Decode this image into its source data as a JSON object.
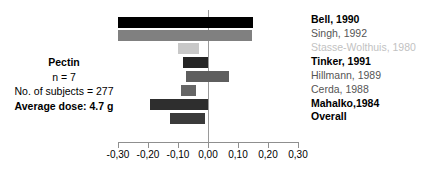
{
  "figure": {
    "info_block": {
      "lines": [
        {
          "text": "Pectin",
          "bold": true
        },
        {
          "text": "n = 7",
          "bold": false
        },
        {
          "text": "No. of subjects = 277",
          "bold": false
        },
        {
          "text": "Average dose: 4.7 g",
          "bold": true
        }
      ]
    },
    "axis": {
      "tick_labels": [
        "-0,30",
        "-0,20",
        "-0,10",
        "0,00",
        "0,10",
        "0,20",
        "0,30"
      ],
      "tick_values": [
        -0.3,
        -0.2,
        -0.1,
        0.0,
        0.1,
        0.2,
        0.3
      ]
    },
    "caption": "",
    "colors": {
      "zero_line": "#9a9a9a",
      "axis": "#8f8f8f",
      "black": "#000000",
      "mid_gray": "#808080",
      "light_gray": "#c8c8c8",
      "dark_gray": "#3a3a3a",
      "gray_55": "#5e5e5e",
      "gray_60": "#666666",
      "label_gray": "#555555",
      "label_light": "#c2c2c2"
    }
  },
  "chart_data": {
    "type": "bar",
    "orientation": "horizontal",
    "title": "",
    "xlabel": "",
    "ylabel": "",
    "xlim": [
      -0.3,
      0.3
    ],
    "grid": false,
    "legend": "none",
    "zero_reference": 0.0,
    "categories": [
      "Bell, 1990",
      "Singh, 1992",
      "Stasse-Wolthuis, 1980",
      "Tinker, 1991",
      "Hillmann, 1989",
      "Cerda, 1988",
      "Mahalko,1984",
      "Overall"
    ],
    "bars": [
      {
        "label": "Bell, 1990",
        "start": -0.3,
        "end": 0.15,
        "color": "#000000",
        "label_color": "#000000",
        "label_bold": true
      },
      {
        "label": "Singh, 1992",
        "start": -0.3,
        "end": 0.145,
        "color": "#808080",
        "label_color": "#555555",
        "label_bold": false
      },
      {
        "label": "Stasse-Wolthuis, 1980",
        "start": -0.1,
        "end": -0.03,
        "color": "#c8c8c8",
        "label_color": "#c2c2c2",
        "label_bold": false
      },
      {
        "label": "Tinker, 1991",
        "start": -0.083,
        "end": 0.0,
        "color": "#252525",
        "label_color": "#000000",
        "label_bold": true
      },
      {
        "label": "Hillmann, 1989",
        "start": -0.075,
        "end": 0.07,
        "color": "#5e5e5e",
        "label_color": "#555555",
        "label_bold": false
      },
      {
        "label": "Cerda, 1988",
        "start": -0.09,
        "end": -0.04,
        "color": "#666666",
        "label_color": "#555555",
        "label_bold": false
      },
      {
        "label": "Mahalko,1984",
        "start": -0.193,
        "end": 0.0,
        "color": "#2e2e2e",
        "label_color": "#000000",
        "label_bold": true
      },
      {
        "label": "Overall",
        "start": -0.127,
        "end": -0.01,
        "color": "#3a3a3a",
        "label_color": "#000000",
        "label_bold": true
      }
    ]
  }
}
